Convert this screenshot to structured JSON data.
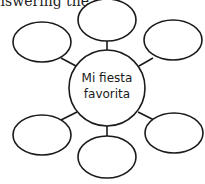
{
  "header": {
    "text": "nswering the"
  },
  "web": {
    "center_label_line1": "Mi fiesta",
    "center_label_line2": "favorita",
    "stroke_color": "#1a1a1a",
    "outer_ovals": 6
  }
}
